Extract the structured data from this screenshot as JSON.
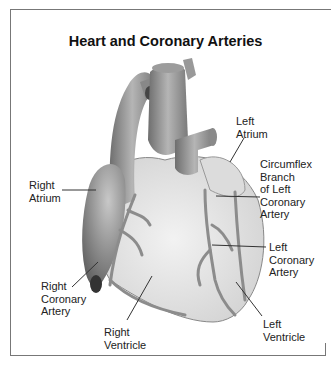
{
  "title": "Heart and Coronary Arteries",
  "labels": {
    "left_atrium": "Left\nAtrium",
    "right_atrium": "Right\nAtrium",
    "circumflex": "Circumflex\nBranch\nof Left\nCoronary\nArtery",
    "left_coronary": "Left\nCoronary\nArtery",
    "right_coronary": "Right\nCoronary\nArtery",
    "right_ventricle": "Right\nVentricle",
    "left_ventricle": "Left\nVentricle"
  },
  "colors": {
    "heart_fill": "#e6e6e6",
    "vessel_fill": "#9a9a9a",
    "atrium_dark": "#7a7a7a",
    "artery": "#8a8a8a",
    "frame": "#777777",
    "leader": "#333333"
  }
}
